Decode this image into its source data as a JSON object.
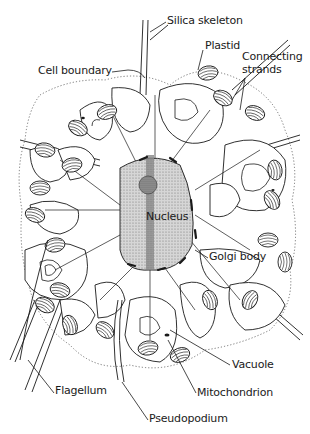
{
  "diagram": {
    "type": "labeled biological illustration",
    "colors": {
      "ink": "#1a1a1a",
      "nucleus_fill": "#cfcfcf",
      "nucleus_dark_band": "#8a8a8a",
      "background": "#ffffff"
    },
    "labels": [
      {
        "id": "silica-skeleton",
        "text": "Silica skeleton",
        "x": 167,
        "y": 15
      },
      {
        "id": "plastid",
        "text": "Plastid",
        "x": 205,
        "y": 40
      },
      {
        "id": "connecting-strands",
        "text": "Connecting",
        "text2": "strands",
        "x": 242,
        "y": 51
      },
      {
        "id": "cell-boundary",
        "text": "Cell boundary",
        "x": 38,
        "y": 65
      },
      {
        "id": "nucleus",
        "text": "Nucleus",
        "x": 146,
        "y": 211
      },
      {
        "id": "golgi-body",
        "text": "Golgi body",
        "x": 209,
        "y": 251
      },
      {
        "id": "vacuole",
        "text": "Vacuole",
        "x": 232,
        "y": 359
      },
      {
        "id": "flagellum",
        "text": "Flagellum",
        "x": 55,
        "y": 385
      },
      {
        "id": "mitochondrion",
        "text": "Mitochondrion",
        "x": 197,
        "y": 387
      },
      {
        "id": "pseudopodium",
        "text": "Pseudopodium",
        "x": 149,
        "y": 413
      }
    ]
  }
}
